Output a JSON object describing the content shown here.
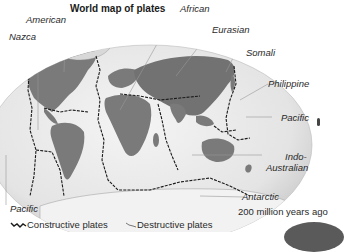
{
  "title": "World map of plates",
  "plates": {
    "american": "American",
    "nazca": "Nazca",
    "african": "African",
    "eurasian": "Eurasian",
    "somali": "Somali",
    "philippine": "Philippine",
    "pacific_right": "Pacific",
    "indo_australian_1": "Indo-",
    "indo_australian_2": "Australian",
    "antarctic": "Antarctic",
    "pacific_left": "Pacific"
  },
  "caption": "200 million years ago",
  "legend": {
    "constructive": "Constructive plates",
    "destructive": "Destructive plates"
  },
  "colors": {
    "ocean": "#e8e8e8",
    "land": "#7a7a7a",
    "boundary": "#1a1a1a",
    "leader": "#888888"
  }
}
